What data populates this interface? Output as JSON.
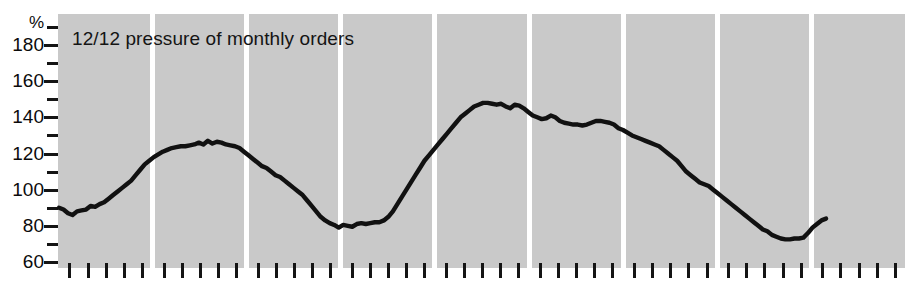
{
  "chart_data": {
    "type": "line",
    "title": "12/12 pressure of monthly orders",
    "xlabel": "",
    "ylabel": "%",
    "ylim": [
      60,
      190
    ],
    "yticks_major": [
      60,
      80,
      100,
      120,
      140,
      160,
      180
    ],
    "yticks_minor": [
      70,
      90,
      110,
      130,
      150,
      170,
      190
    ],
    "grid": false,
    "legend": "none",
    "panel_count": 9,
    "ticks_per_panel": 5,
    "series": [
      {
        "name": "12/12 pressure of monthly orders",
        "values": [
          90,
          89,
          87,
          86,
          88,
          88.5,
          89,
          91,
          90.5,
          92,
          93,
          95,
          97,
          99,
          101,
          103,
          105,
          108,
          111,
          114,
          116,
          118,
          119.5,
          121,
          122,
          123,
          123.5,
          124,
          124,
          124.5,
          125,
          126,
          125,
          127,
          125.5,
          126.5,
          126,
          125,
          124.5,
          124,
          123,
          121,
          119,
          117,
          115,
          113,
          112,
          110,
          108,
          107,
          105,
          103,
          101,
          99,
          97,
          94,
          91,
          88,
          85,
          83,
          81.5,
          80.5,
          79,
          80.5,
          80,
          79.5,
          81,
          81.5,
          81,
          81.5,
          82,
          82,
          83,
          85,
          88,
          92,
          96,
          100,
          104,
          108,
          112,
          116,
          119,
          122,
          125,
          128,
          131,
          134,
          137,
          140,
          142,
          144,
          146,
          147,
          148,
          148,
          147.5,
          147,
          147.5,
          146,
          145,
          147,
          146.5,
          145,
          143,
          141,
          140,
          139,
          139.5,
          141,
          140,
          138,
          137,
          136.5,
          136,
          136,
          135.5,
          136,
          137,
          138,
          138,
          137.5,
          137,
          136,
          134,
          133,
          131.5,
          130,
          129,
          128,
          127,
          126,
          125,
          124,
          122,
          120,
          118,
          116,
          113,
          110,
          108,
          106,
          104,
          103,
          102,
          100,
          98,
          96,
          94,
          92,
          90,
          88,
          86,
          84,
          82,
          80,
          78,
          77,
          75,
          74,
          73,
          72.5,
          72.5,
          73,
          73,
          73.5,
          76,
          79,
          81,
          83,
          84
        ]
      }
    ]
  }
}
